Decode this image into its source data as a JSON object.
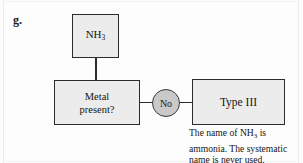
{
  "item_label": "g.",
  "flowchart": {
    "formula_node": {
      "text_before_sub": "NH",
      "subscript": "3"
    },
    "decision_node": {
      "line1": "Metal",
      "line2": "present?"
    },
    "branch_label": "No",
    "result_node": {
      "label": "Type III"
    }
  },
  "caption": {
    "part1": "The name of NH",
    "subscript": "3",
    "part2": " is ammonia. The systematic name is never used."
  },
  "colors": {
    "box_fill": "#ececec",
    "box_border": "#2b2b2b",
    "circle_fill": "#c9c9c9",
    "circle_border": "#3a3a3a",
    "text": "#141414",
    "page_background": "#fdfdfd"
  }
}
